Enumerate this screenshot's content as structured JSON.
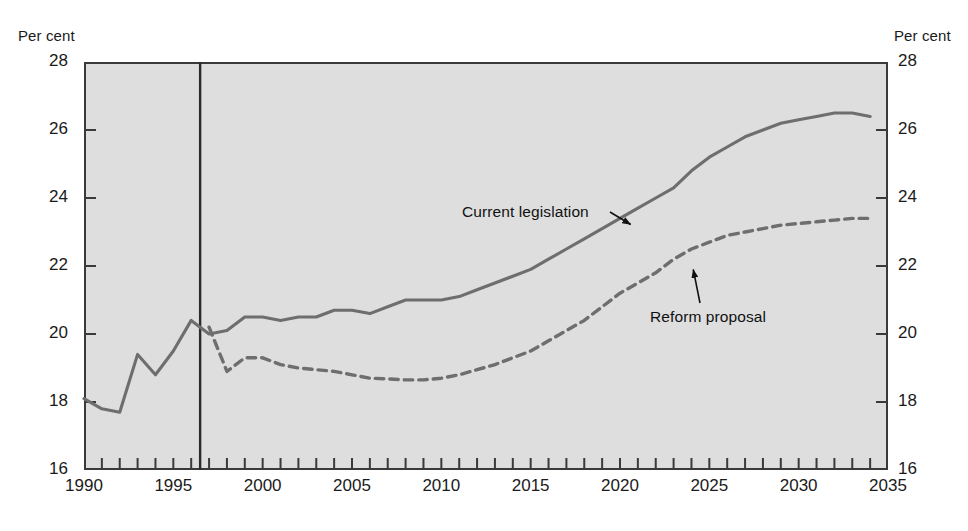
{
  "axis_titles": {
    "left": "Per cent",
    "right": "Per cent"
  },
  "y_ticks": [
    "16",
    "18",
    "20",
    "22",
    "24",
    "26",
    "28"
  ],
  "x_ticks": [
    "1990",
    "1995",
    "2000",
    "2005",
    "2010",
    "2015",
    "2020",
    "2025",
    "2030",
    "2035"
  ],
  "annotations": {
    "current": "Current legislation",
    "reform": "Reform proposal"
  },
  "colors": {
    "plot_background": "#dedede",
    "axis": "#3a3a3a",
    "current_line": "#6e6e6e",
    "reform_line": "#6e6e6e",
    "text": "#1a1a1a",
    "annotation_arrow": "#111111",
    "divider": "#2b2b2b"
  },
  "chart_data": {
    "type": "line",
    "title": "",
    "subtitle": "",
    "xlabel": "",
    "ylabel": "Per cent",
    "xlim": [
      1990,
      2035
    ],
    "ylim": [
      16,
      28
    ],
    "y_tick_values": [
      16,
      18,
      20,
      22,
      24,
      26,
      28
    ],
    "x_tick_values": [
      1990,
      1995,
      2000,
      2005,
      2010,
      2015,
      2020,
      2025,
      2030,
      2035
    ],
    "x_minor_tick_interval": 1,
    "grid": false,
    "legend": "inline-annotations",
    "projection_divider_x": 1996.5,
    "series": [
      {
        "name": "Current legislation",
        "style": "solid",
        "color": "#6e6e6e",
        "x": [
          1990,
          1991,
          1992,
          1993,
          1994,
          1995,
          1996,
          1997,
          1998,
          1999,
          2000,
          2001,
          2002,
          2003,
          2004,
          2005,
          2006,
          2007,
          2008,
          2009,
          2010,
          2011,
          2012,
          2013,
          2014,
          2015,
          2016,
          2017,
          2018,
          2019,
          2020,
          2021,
          2022,
          2023,
          2024,
          2025,
          2026,
          2027,
          2028,
          2029,
          2030,
          2031,
          2032,
          2033,
          2034
        ],
        "y": [
          18.1,
          17.8,
          17.7,
          19.4,
          18.8,
          19.5,
          20.4,
          20.0,
          20.1,
          20.5,
          20.5,
          20.4,
          20.5,
          20.5,
          20.7,
          20.7,
          20.6,
          20.8,
          21.0,
          21.0,
          21.0,
          21.1,
          21.3,
          21.5,
          21.7,
          21.9,
          22.2,
          22.5,
          22.8,
          23.1,
          23.4,
          23.7,
          24.0,
          24.3,
          24.8,
          25.2,
          25.5,
          25.8,
          26.0,
          26.2,
          26.3,
          26.4,
          26.5,
          26.5,
          26.4
        ]
      },
      {
        "name": "Reform proposal",
        "style": "dashed",
        "color": "#6e6e6e",
        "x": [
          1997,
          1998,
          1999,
          2000,
          2001,
          2002,
          2003,
          2004,
          2005,
          2006,
          2007,
          2008,
          2009,
          2010,
          2011,
          2012,
          2013,
          2014,
          2015,
          2016,
          2017,
          2018,
          2019,
          2020,
          2021,
          2022,
          2023,
          2024,
          2025,
          2026,
          2027,
          2028,
          2029,
          2030,
          2031,
          2032,
          2033,
          2034
        ],
        "y": [
          20.2,
          18.9,
          19.3,
          19.3,
          19.1,
          19.0,
          18.95,
          18.9,
          18.8,
          18.7,
          18.68,
          18.65,
          18.65,
          18.7,
          18.8,
          18.95,
          19.1,
          19.3,
          19.5,
          19.8,
          20.1,
          20.4,
          20.8,
          21.2,
          21.5,
          21.8,
          22.2,
          22.5,
          22.7,
          22.9,
          23.0,
          23.1,
          23.2,
          23.25,
          23.3,
          23.35,
          23.4,
          23.4
        ]
      }
    ],
    "annotations": [
      {
        "text": "Current legislation",
        "x": 2018.5,
        "y": 23.3,
        "arrow_to_x": 2020.8,
        "arrow_to_y": 23.25
      },
      {
        "text": "Reform proposal",
        "x": 2025.6,
        "y": 20.8,
        "arrow_to_x": 2024.2,
        "arrow_to_y": 21.8
      }
    ]
  }
}
